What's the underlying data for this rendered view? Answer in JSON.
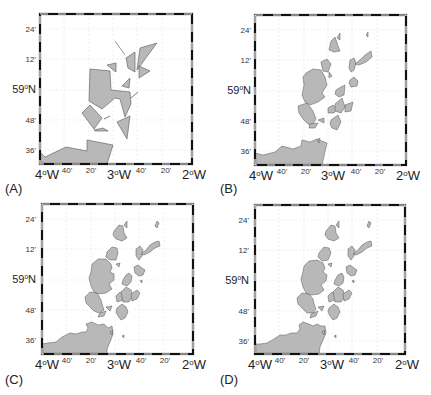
{
  "figure": {
    "panels": [
      {
        "id": "A",
        "label": "(A)"
      },
      {
        "id": "B",
        "label": "(B)"
      },
      {
        "id": "C",
        "label": "(C)"
      },
      {
        "id": "D",
        "label": "(D)"
      }
    ],
    "y_ticks": [
      {
        "text": "24'",
        "major": false
      },
      {
        "text": "12'",
        "major": false
      },
      {
        "text": "59",
        "suffix": "N",
        "major": true
      },
      {
        "text": "48'",
        "major": false
      },
      {
        "text": "36'",
        "major": false
      }
    ],
    "x_ticks": [
      {
        "text": "4",
        "suffix": "W",
        "major": true
      },
      {
        "text": "40'",
        "major": false
      },
      {
        "text": "20'",
        "major": false
      },
      {
        "text": "3",
        "suffix": "W",
        "major": true
      },
      {
        "text": "40'",
        "major": false
      },
      {
        "text": "20'",
        "major": false
      },
      {
        "text": "2",
        "suffix": "W",
        "major": true
      }
    ],
    "degree_symbol": "o",
    "colors": {
      "land_fill": "#b8b8b8",
      "land_stroke": "#555555",
      "grid": "#e6e6e6",
      "frame_dark": "#111111",
      "frame_light": "#ffffff"
    }
  }
}
